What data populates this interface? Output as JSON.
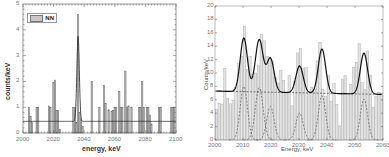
{
  "chart_data": [
    {
      "type": "bar",
      "panel": "left",
      "xlabel": "energy, keV",
      "ylabel": "counts/keV",
      "xlim": [
        2000,
        2100
      ],
      "ylim": [
        0,
        5
      ],
      "xticks": [
        "2000",
        "2020",
        "2040",
        "2060",
        "2080",
        "2100"
      ],
      "yticks": [
        "0",
        "1",
        "2",
        "3",
        "4",
        "5"
      ],
      "legend": [
        {
          "label": "NN",
          "style": "gray-bar"
        }
      ],
      "bars": [
        {
          "x": 2004,
          "y": 1.0
        },
        {
          "x": 2005,
          "y": 0.65
        },
        {
          "x": 2006,
          "y": 0.4
        },
        {
          "x": 2009,
          "y": 1.0
        },
        {
          "x": 2010,
          "y": 1.0
        },
        {
          "x": 2017,
          "y": 1.05
        },
        {
          "x": 2018,
          "y": 1.0
        },
        {
          "x": 2020,
          "y": 1.95
        },
        {
          "x": 2021,
          "y": 2.05
        },
        {
          "x": 2022,
          "y": 0.88
        },
        {
          "x": 2023,
          "y": 0.88
        },
        {
          "x": 2024,
          "y": 0.15
        },
        {
          "x": 2033,
          "y": 1.0
        },
        {
          "x": 2034,
          "y": 1.0
        },
        {
          "x": 2035,
          "y": 0.4
        },
        {
          "x": 2036,
          "y": 4.6
        },
        {
          "x": 2037,
          "y": 0.8
        },
        {
          "x": 2038,
          "y": 0.55
        },
        {
          "x": 2039,
          "y": 0.25
        },
        {
          "x": 2045,
          "y": 2.0
        },
        {
          "x": 2050,
          "y": 1.0
        },
        {
          "x": 2053,
          "y": 1.85
        },
        {
          "x": 2054,
          "y": 1.15
        },
        {
          "x": 2056,
          "y": 0.9
        },
        {
          "x": 2058,
          "y": 0.85
        },
        {
          "x": 2059,
          "y": 0.88
        },
        {
          "x": 2060,
          "y": 1.0
        },
        {
          "x": 2061,
          "y": 1.0
        },
        {
          "x": 2063,
          "y": 1.6
        },
        {
          "x": 2064,
          "y": 1.0
        },
        {
          "x": 2065,
          "y": 1.0
        },
        {
          "x": 2067,
          "y": 2.4
        },
        {
          "x": 2068,
          "y": 1.0
        },
        {
          "x": 2069,
          "y": 1.05
        },
        {
          "x": 2071,
          "y": 1.0
        },
        {
          "x": 2076,
          "y": 1.0
        },
        {
          "x": 2077,
          "y": 1.0
        },
        {
          "x": 2078,
          "y": 2.0
        },
        {
          "x": 2079,
          "y": 1.0
        },
        {
          "x": 2081,
          "y": 1.0
        },
        {
          "x": 2082,
          "y": 1.0
        },
        {
          "x": 2083,
          "y": 0.7
        },
        {
          "x": 2084,
          "y": 0.35
        },
        {
          "x": 2089,
          "y": 1.0
        },
        {
          "x": 2090,
          "y": 1.0
        },
        {
          "x": 2097,
          "y": 1.0
        },
        {
          "x": 2098,
          "y": 1.0
        },
        {
          "x": 2099,
          "y": 1.0
        }
      ],
      "fit": {
        "background": 0.45,
        "peaks": [
          {
            "center": 2036,
            "amplitude": 3.3,
            "sigma": 0.8
          }
        ]
      }
    },
    {
      "type": "bar",
      "panel": "right",
      "xlabel": "Energy, keV",
      "ylabel": "Counts/keV",
      "xlim": [
        2000,
        2060
      ],
      "ylim": [
        0,
        20
      ],
      "xticks": [
        "2000",
        "2010",
        "2020",
        "2030",
        "2040",
        "2050",
        "2060"
      ],
      "yticks": [
        "0",
        "2",
        "4",
        "6",
        "8",
        "10",
        "12",
        "14",
        "16",
        "18",
        "20"
      ],
      "bar_width_keV": 1,
      "bars": [
        4.6,
        5.5,
        5.3,
        10.7,
        6.2,
        5.4,
        5.9,
        7.8,
        11.4,
        12.5,
        17.0,
        10.5,
        12.5,
        9.5,
        10.0,
        11.2,
        15.8,
        14.8,
        12.5,
        12.4,
        11.8,
        9.3,
        8.5,
        10.4,
        8.9,
        7.0,
        9.6,
        5.1,
        8.8,
        13.0,
        13.7,
        10.7,
        10.8,
        7.3,
        7.9,
        7.5,
        11.8,
        14.6,
        7.6,
        6.5,
        9.6,
        5.8,
        8.5,
        5.3,
        2.1,
        9.0,
        9.6,
        6.9,
        8.3,
        10.8,
        11.6,
        14.4,
        8.6,
        7.5,
        13.3,
        9.7,
        4.9,
        6.5,
        7.1,
        6.9
      ],
      "fit": {
        "background_start": 7.3,
        "background_end": 6.8,
        "peaks": [
          {
            "center": 2010.3,
            "amplitude": 8.0,
            "sigma": 1.3
          },
          {
            "center": 2015.8,
            "amplitude": 7.8,
            "sigma": 1.4
          },
          {
            "center": 2019.8,
            "amplitude": 5.0,
            "sigma": 1.3
          },
          {
            "center": 2030.2,
            "amplitude": 4.0,
            "sigma": 1.3
          },
          {
            "center": 2038.2,
            "amplitude": 6.6,
            "sigma": 1.3
          },
          {
            "center": 2053.2,
            "amplitude": 6.1,
            "sigma": 1.3
          }
        ]
      }
    }
  ],
  "left": {
    "xlabel": "energy, keV",
    "ylabel": "counts/keV",
    "legend_label": "NN"
  },
  "right": {
    "xlabel": "Energy, keV",
    "ylabel": "Counts/keV"
  }
}
